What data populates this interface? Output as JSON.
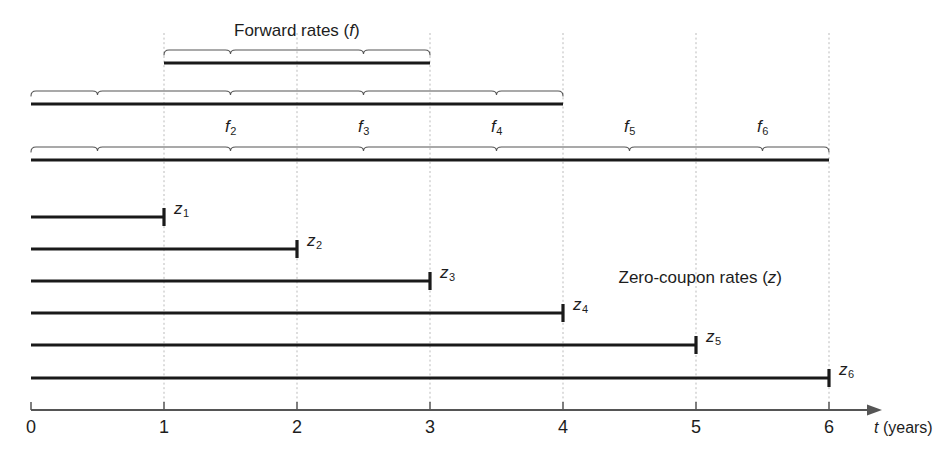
{
  "figure": {
    "headings": {
      "forward": "Forward rates (f)",
      "forward_text": "Forward rates (",
      "forward_sym": "f",
      "forward_tail": ")",
      "zero": "Zero-coupon rates (z)",
      "zero_text": "Zero-coupon rates (",
      "zero_sym": "z",
      "zero_tail": ")"
    },
    "axis": {
      "label_sym": "t",
      "label_unit": " (years)",
      "ticks": [
        "0",
        "1",
        "2",
        "3",
        "4",
        "5",
        "6"
      ],
      "tick_values": [
        0,
        1,
        2,
        3,
        4,
        5,
        6
      ],
      "x0_px": 31,
      "step_px": 133,
      "y_px": 410
    },
    "colors": {
      "ink": "#1d1d1d",
      "bar": "#1a1a1a",
      "brace": "#555555",
      "gridline": "#bbbbbb",
      "axis": "#555555",
      "background": "#ffffff"
    },
    "forward_rows": [
      {
        "name": "row-1-3",
        "start": 1,
        "end": 3,
        "segments": [
          [
            1,
            2
          ],
          [
            2,
            3
          ]
        ],
        "bar_y": 63,
        "brace_y": 50,
        "labels": []
      },
      {
        "name": "row-0-4",
        "start": 0,
        "end": 4,
        "segments": [
          [
            0,
            1
          ],
          [
            1,
            2
          ],
          [
            2,
            3
          ],
          [
            3,
            4
          ]
        ],
        "bar_y": 104,
        "brace_y": 91,
        "labels": []
      },
      {
        "name": "row-0-6",
        "start": 0,
        "end": 6,
        "segments": [
          [
            0,
            1
          ],
          [
            1,
            2
          ],
          [
            2,
            3
          ],
          [
            3,
            4
          ],
          [
            4,
            5
          ],
          [
            5,
            6
          ]
        ],
        "bar_y": 160,
        "brace_y": 147,
        "labels": [
          {
            "sym": "f",
            "sub": "2",
            "mid": 1.5
          },
          {
            "sym": "f",
            "sub": "3",
            "mid": 2.5
          },
          {
            "sym": "f",
            "sub": "4",
            "mid": 3.5
          },
          {
            "sym": "f",
            "sub": "5",
            "mid": 4.5
          },
          {
            "sym": "f",
            "sub": "6",
            "mid": 5.5
          }
        ]
      }
    ],
    "zero_bars": [
      {
        "sym": "z",
        "sub": "1",
        "start": 0,
        "end": 1,
        "y": 217
      },
      {
        "sym": "z",
        "sub": "2",
        "start": 0,
        "end": 2,
        "y": 249
      },
      {
        "sym": "z",
        "sub": "3",
        "start": 0,
        "end": 3,
        "y": 281
      },
      {
        "sym": "z",
        "sub": "4",
        "start": 0,
        "end": 4,
        "y": 313
      },
      {
        "sym": "z",
        "sub": "5",
        "start": 0,
        "end": 5,
        "y": 345
      },
      {
        "sym": "z",
        "sub": "6",
        "start": 0,
        "end": 6,
        "y": 378
      }
    ],
    "forward_title_mid": 2.0,
    "forward_title_y": 22,
    "zero_title_x": 700,
    "zero_title_y": 269,
    "gridlines": [
      1,
      2,
      3,
      4,
      5,
      6
    ],
    "grid_top": 33,
    "grid_bottom": 404
  }
}
